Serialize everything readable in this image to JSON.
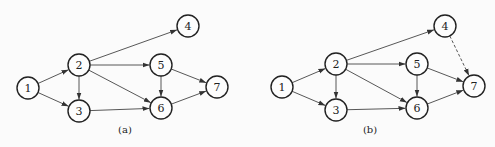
{
  "panels": [
    {
      "id": "a",
      "caption": "(a)",
      "caption_pos": [
        125,
        133
      ],
      "nodes": [
        {
          "label": "1",
          "x": 28,
          "y": 88
        },
        {
          "label": "2",
          "x": 79,
          "y": 65
        },
        {
          "label": "3",
          "x": 79,
          "y": 111
        },
        {
          "label": "4",
          "x": 188,
          "y": 26
        },
        {
          "label": "5",
          "x": 161,
          "y": 65
        },
        {
          "label": "6",
          "x": 161,
          "y": 108
        },
        {
          "label": "7",
          "x": 217,
          "y": 87
        }
      ],
      "edges": [
        {
          "from": "1",
          "to": "2",
          "style": "solid"
        },
        {
          "from": "1",
          "to": "3",
          "style": "solid"
        },
        {
          "from": "2",
          "to": "3",
          "style": "solid"
        },
        {
          "from": "2",
          "to": "4",
          "style": "solid"
        },
        {
          "from": "2",
          "to": "5",
          "style": "solid"
        },
        {
          "from": "2",
          "to": "6",
          "style": "solid"
        },
        {
          "from": "3",
          "to": "6",
          "style": "solid"
        },
        {
          "from": "5",
          "to": "6",
          "style": "solid"
        },
        {
          "from": "5",
          "to": "7",
          "style": "solid"
        },
        {
          "from": "6",
          "to": "7",
          "style": "solid"
        }
      ]
    },
    {
      "id": "b",
      "caption": "(b)",
      "caption_pos": [
        370,
        133
      ],
      "nodes": [
        {
          "label": "1",
          "x": 282,
          "y": 87
        },
        {
          "label": "2",
          "x": 336,
          "y": 64
        },
        {
          "label": "3",
          "x": 336,
          "y": 110
        },
        {
          "label": "4",
          "x": 445,
          "y": 26
        },
        {
          "label": "5",
          "x": 417,
          "y": 64
        },
        {
          "label": "6",
          "x": 417,
          "y": 108
        },
        {
          "label": "7",
          "x": 474,
          "y": 86
        }
      ],
      "edges": [
        {
          "from": "1",
          "to": "2",
          "style": "solid"
        },
        {
          "from": "1",
          "to": "3",
          "style": "solid"
        },
        {
          "from": "2",
          "to": "3",
          "style": "solid"
        },
        {
          "from": "2",
          "to": "4",
          "style": "solid"
        },
        {
          "from": "2",
          "to": "5",
          "style": "solid"
        },
        {
          "from": "2",
          "to": "6",
          "style": "solid"
        },
        {
          "from": "3",
          "to": "6",
          "style": "solid"
        },
        {
          "from": "5",
          "to": "6",
          "style": "solid"
        },
        {
          "from": "5",
          "to": "7",
          "style": "solid"
        },
        {
          "from": "6",
          "to": "7",
          "style": "solid"
        },
        {
          "from": "4",
          "to": "7",
          "style": "dashed"
        }
      ]
    }
  ],
  "node_radius": 11
}
